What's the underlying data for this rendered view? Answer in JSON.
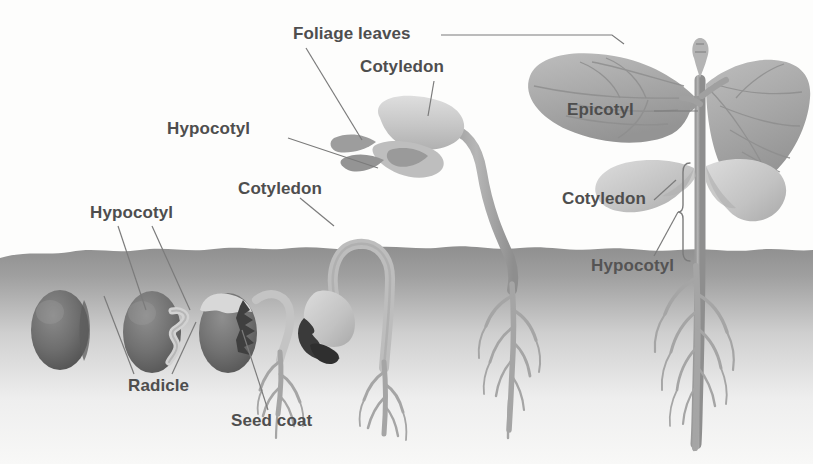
{
  "figure": {
    "background_color": "#fdfdfc",
    "label_color": "#4e4e4e",
    "soil_color": "#9a9a9a",
    "seed_color": "#6f6f6f",
    "cotyledon_color": "#c9c9c9",
    "leaf_color": "#adadad",
    "stem_color": "#a8a8a8",
    "root_color": "#a5a5a5",
    "seed_coat_dark_color": "#3d3d3d"
  },
  "labels": {
    "foliage_leaves": "Foliage leaves",
    "cotyledon_top": "Cotyledon",
    "hypocotyl_mid": "Hypocotyl",
    "cotyledon_mid": "Cotyledon",
    "hypocotyl_left": "Hypocotyl",
    "radicle": "Radicle",
    "seed_coat": "Seed coat",
    "epicotyl": "Epicotyl",
    "cotyledon_right": "Cotyledon",
    "hypocotyl_right": "Hypocotyl"
  },
  "stages": [
    {
      "name": "dormant-seed",
      "description": "Intact bean seed below soil"
    },
    {
      "name": "radicle-emergence",
      "description": "Seed with emerging radicle"
    },
    {
      "name": "root-development",
      "description": "Seed coat splitting, roots branching"
    },
    {
      "name": "hypocotyl-arch",
      "description": "Hypocotyl arch pulling cotyledons upward"
    },
    {
      "name": "cotyledon-expansion",
      "description": "Cotyledons above soil with first foliage leaves"
    },
    {
      "name": "mature-seedling",
      "description": "Erect seedling with epicotyl and foliage leaves"
    }
  ]
}
